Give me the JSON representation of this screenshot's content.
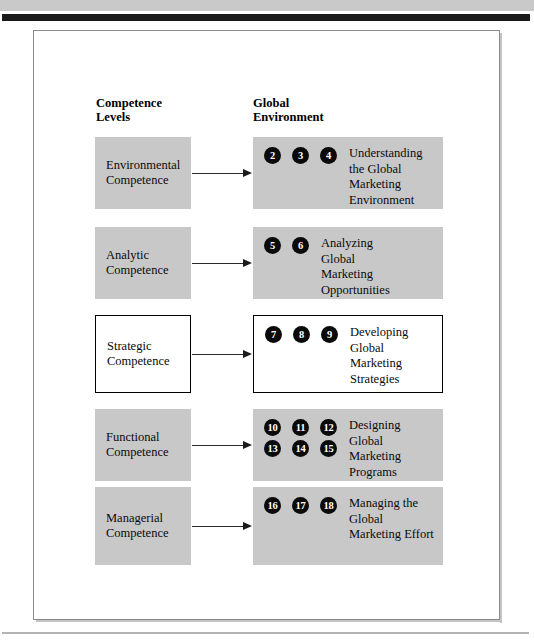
{
  "figure": {
    "columns": {
      "left_heading": "Competence\nLevels",
      "right_heading": "Global\nEnvironment"
    },
    "rows": [
      {
        "level": "Environmental\nCompetence",
        "level_style": "filled",
        "env_style": "filled",
        "badge_rows": [
          [
            "2",
            "3",
            "4"
          ]
        ],
        "env_label": "Understanding\nthe Global\nMarketing\nEnvironment"
      },
      {
        "level": "Analytic\nCompetence",
        "level_style": "filled",
        "env_style": "filled",
        "badge_rows": [
          [
            "5",
            "6"
          ]
        ],
        "env_label": "Analyzing\nGlobal\nMarketing\nOpportunities"
      },
      {
        "level": "Strategic\nCompetence",
        "level_style": "outlined",
        "env_style": "outlined",
        "badge_rows": [
          [
            "7",
            "8",
            "9"
          ]
        ],
        "env_label": "Developing\nGlobal\nMarketing\nStrategies"
      },
      {
        "level": "Functional\nCompetence",
        "level_style": "filled",
        "env_style": "filled",
        "badge_rows": [
          [
            "10",
            "11",
            "12"
          ],
          [
            "13",
            "14",
            "15"
          ]
        ],
        "env_label": "Designing\nGlobal\nMarketing\nPrograms"
      },
      {
        "level": "Managerial\nCompetence",
        "level_style": "filled",
        "env_style": "filled",
        "badge_rows": [
          [
            "16",
            "17",
            "18"
          ]
        ],
        "env_label": "Managing the\nGlobal\nMarketing Effort"
      }
    ],
    "colors": {
      "box_fill": "#c8c8c8",
      "outline": "#000000",
      "badge_fill": "#0a0a0a",
      "badge_text": "#ffffff",
      "rule": "#1a1a1a"
    }
  }
}
